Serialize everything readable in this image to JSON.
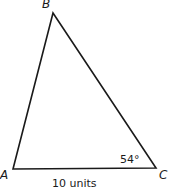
{
  "diagram": {
    "type": "triangle",
    "vertices": {
      "A": {
        "label": "A",
        "x": 13,
        "y": 169
      },
      "B": {
        "label": "B",
        "x": 53,
        "y": 13
      },
      "C": {
        "label": "C",
        "x": 156,
        "y": 168
      }
    },
    "angle_C": "54°",
    "side_AC": "10 units",
    "stroke_color": "#1a1a1a"
  }
}
